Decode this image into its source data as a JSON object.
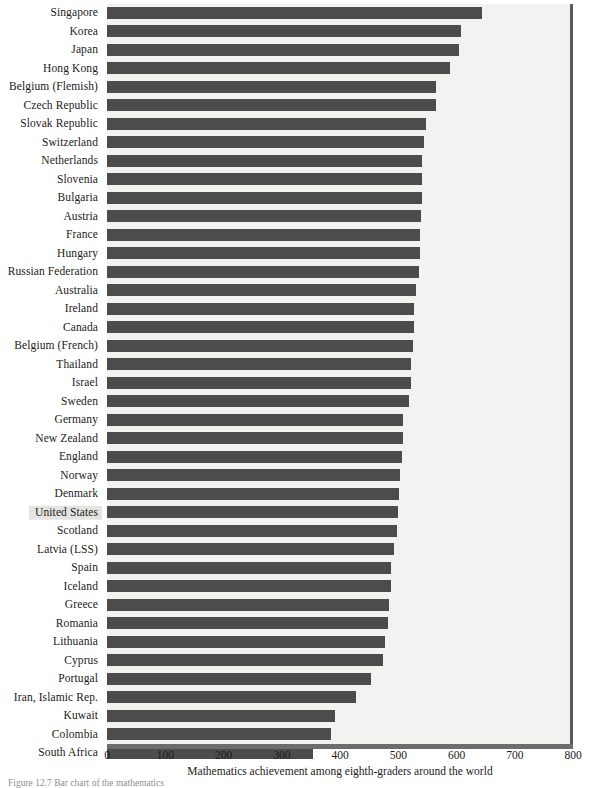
{
  "chart_data": {
    "type": "bar",
    "orientation": "horizontal",
    "title": "",
    "xlabel": "Mathematics achievement among eighth-graders around the world",
    "ylabel": "",
    "xlim": [
      0,
      800
    ],
    "xticks": [
      0,
      100,
      200,
      300,
      400,
      500,
      600,
      700,
      800
    ],
    "xtick_labels": [
      "0",
      "100",
      "200",
      "300",
      "400",
      "500",
      "600",
      "700",
      "800"
    ],
    "grid": false,
    "legend": null,
    "bar_color": "#4c4c4c",
    "plot_background": "#f2f2f0",
    "highlighted_category": "United States",
    "categories": [
      "Singapore",
      "Korea",
      "Japan",
      "Hong Kong",
      "Belgium (Flemish)",
      "Czech Republic",
      "Slovak Republic",
      "Switzerland",
      "Netherlands",
      "Slovenia",
      "Bulgaria",
      "Austria",
      "France",
      "Hungary",
      "Russian Federation",
      "Australia",
      "Ireland",
      "Canada",
      "Belgium (French)",
      "Thailand",
      "Israel",
      "Sweden",
      "Germany",
      "New Zealand",
      "England",
      "Norway",
      "Denmark",
      "United States",
      "Scotland",
      "Latvia (LSS)",
      "Spain",
      "Iceland",
      "Greece",
      "Romania",
      "Lithuania",
      "Cyprus",
      "Portugal",
      "Iran, Islamic Rep.",
      "Kuwait",
      "Colombia",
      "South Africa"
    ],
    "values": [
      643,
      607,
      605,
      588,
      565,
      564,
      547,
      545,
      541,
      541,
      540,
      539,
      538,
      537,
      535,
      530,
      527,
      527,
      526,
      522,
      522,
      519,
      509,
      508,
      506,
      503,
      502,
      500,
      498,
      493,
      487,
      487,
      484,
      482,
      477,
      474,
      454,
      428,
      392,
      385,
      354
    ]
  },
  "axis": {
    "title": "Mathematics achievement among eighth-graders around the world"
  },
  "caption": {
    "text": "Figure 12.7    Bar chart of the mathematics"
  }
}
